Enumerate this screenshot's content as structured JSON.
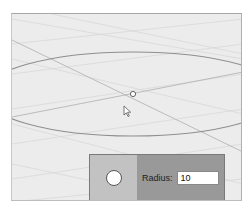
{
  "viewport": {
    "background": "#ececec",
    "center_point": {
      "x": 121,
      "y": 80
    },
    "cursor": {
      "x": 112,
      "y": 92
    }
  },
  "panel": {
    "shape_icon": "circle-icon",
    "radius_label": "Radius:",
    "radius_value": "10"
  },
  "colors": {
    "panel_left": "#c2c2c2",
    "panel_right": "#999999",
    "curve": "#8a8a8a",
    "grid": "#d6d6d6"
  }
}
